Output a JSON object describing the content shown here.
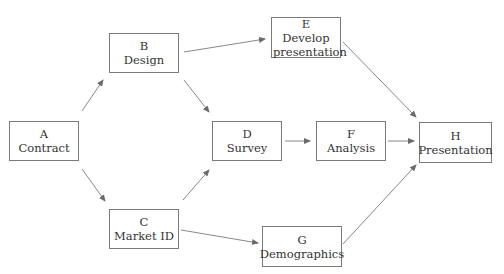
{
  "diagram": {
    "type": "activity-on-node network",
    "nodes": [
      {
        "id": "A",
        "label": "Contract",
        "x": 9,
        "y": 121,
        "w": 70,
        "h": 40
      },
      {
        "id": "B",
        "label": "Design",
        "x": 109,
        "y": 33,
        "w": 70,
        "h": 40
      },
      {
        "id": "C",
        "label": "Market ID",
        "x": 109,
        "y": 209,
        "w": 70,
        "h": 40
      },
      {
        "id": "D",
        "label": "Survey",
        "x": 212,
        "y": 121,
        "w": 70,
        "h": 40
      },
      {
        "id": "E",
        "label": "Develop presentation",
        "x": 271,
        "y": 17,
        "w": 70,
        "h": 41
      },
      {
        "id": "F",
        "label": "Analysis",
        "x": 316,
        "y": 121,
        "w": 70,
        "h": 40
      },
      {
        "id": "G",
        "label": "Demographics",
        "x": 262,
        "y": 226,
        "w": 80,
        "h": 41
      },
      {
        "id": "H",
        "label": "Presentation",
        "x": 419,
        "y": 122,
        "w": 73,
        "h": 41
      }
    ],
    "edges": [
      {
        "from": "A",
        "to": "B",
        "x1": 82,
        "y1": 111,
        "x2": 103,
        "y2": 80
      },
      {
        "from": "A",
        "to": "C",
        "x1": 82,
        "y1": 169,
        "x2": 105,
        "y2": 201
      },
      {
        "from": "B",
        "to": "E",
        "x1": 184,
        "y1": 52,
        "x2": 265,
        "y2": 39
      },
      {
        "from": "B",
        "to": "D",
        "x1": 184,
        "y1": 80,
        "x2": 209,
        "y2": 112
      },
      {
        "from": "C",
        "to": "D",
        "x1": 183,
        "y1": 200,
        "x2": 209,
        "y2": 170
      },
      {
        "from": "C",
        "to": "G",
        "x1": 181,
        "y1": 230,
        "x2": 258,
        "y2": 243
      },
      {
        "from": "D",
        "to": "F",
        "x1": 285,
        "y1": 141,
        "x2": 310,
        "y2": 141
      },
      {
        "from": "F",
        "to": "H",
        "x1": 388,
        "y1": 141,
        "x2": 414,
        "y2": 141
      },
      {
        "from": "E",
        "to": "H",
        "x1": 343,
        "y1": 42,
        "x2": 416,
        "y2": 117
      },
      {
        "from": "G",
        "to": "H",
        "x1": 343,
        "y1": 244,
        "x2": 416,
        "y2": 165
      }
    ],
    "colors": {
      "line": "#7a7a7a",
      "border": "#7a7a7a",
      "text": "#333333"
    }
  }
}
